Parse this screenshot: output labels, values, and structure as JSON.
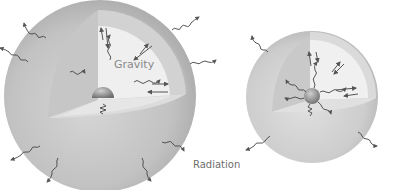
{
  "figure": {
    "labels": {
      "gravity": "Gravity",
      "radiation": "Radiation"
    },
    "large_star": {
      "label": "Gravity"
    },
    "small_star": {
      "label": ""
    },
    "colors": {
      "sphere_outer": "#c4c4c4",
      "sphere_rim": "#b0b0b0",
      "cutaway_wall": "#bdbdbd",
      "cutaway_face_light": "#ececec",
      "cutaway_floor": "#dedede",
      "core": "#8f8f8f",
      "arrows": "#555555",
      "background": "#ffffff"
    }
  }
}
